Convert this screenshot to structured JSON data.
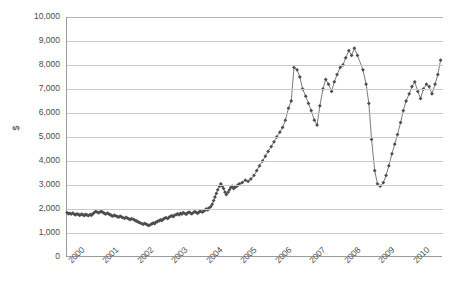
{
  "chart_data": {
    "type": "line",
    "title": "",
    "subtitle": "",
    "xlabel": "",
    "ylabel": "$",
    "legend": [],
    "legend_position": "none",
    "grid": true,
    "marker": "diamond",
    "marker_color": "#4d4d4d",
    "line_color": "#595959",
    "xlim": [
      2000,
      2010.9
    ],
    "ylim": [
      0,
      10000
    ],
    "ytick_labels": [
      "10,000",
      "9,000",
      "8,000",
      "7,000",
      "6,000",
      "5,000",
      "4,000",
      "3,000",
      "2,000",
      "1,000",
      "0"
    ],
    "ytick_values": [
      10000,
      9000,
      8000,
      7000,
      6000,
      5000,
      4000,
      3000,
      2000,
      1000,
      0
    ],
    "xtick_labels": [
      "2000",
      "2001",
      "2002",
      "2003",
      "2004",
      "2005",
      "2006",
      "2007",
      "2008",
      "2009",
      "2010"
    ],
    "xtick_values": [
      2000,
      2001,
      2002,
      2003,
      2004,
      2005,
      2006,
      2007,
      2008,
      2009,
      2010
    ],
    "series": [
      {
        "name": "$",
        "x": [
          2000.0,
          2000.04,
          2000.08,
          2000.12,
          2000.17,
          2000.21,
          2000.25,
          2000.29,
          2000.33,
          2000.37,
          2000.42,
          2000.46,
          2000.5,
          2000.54,
          2000.58,
          2000.62,
          2000.67,
          2000.71,
          2000.75,
          2000.79,
          2000.83,
          2000.87,
          2000.92,
          2000.96,
          2001.0,
          2001.04,
          2001.08,
          2001.12,
          2001.17,
          2001.21,
          2001.25,
          2001.29,
          2001.33,
          2001.37,
          2001.42,
          2001.46,
          2001.5,
          2001.54,
          2001.58,
          2001.62,
          2001.67,
          2001.71,
          2001.75,
          2001.79,
          2001.83,
          2001.87,
          2001.92,
          2001.96,
          2002.0,
          2002.04,
          2002.08,
          2002.12,
          2002.17,
          2002.21,
          2002.25,
          2002.29,
          2002.33,
          2002.37,
          2002.42,
          2002.46,
          2002.5,
          2002.54,
          2002.58,
          2002.62,
          2002.67,
          2002.71,
          2002.75,
          2002.79,
          2002.83,
          2002.87,
          2002.92,
          2002.96,
          2003.0,
          2003.04,
          2003.08,
          2003.12,
          2003.17,
          2003.21,
          2003.25,
          2003.29,
          2003.33,
          2003.37,
          2003.42,
          2003.46,
          2003.5,
          2003.54,
          2003.58,
          2003.62,
          2003.67,
          2003.71,
          2003.75,
          2003.79,
          2003.83,
          2003.87,
          2003.92,
          2003.96,
          2004.0,
          2004.04,
          2004.08,
          2004.12,
          2004.17,
          2004.21,
          2004.25,
          2004.29,
          2004.33,
          2004.37,
          2004.42,
          2004.46,
          2004.5,
          2004.54,
          2004.58,
          2004.62,
          2004.67,
          2004.71,
          2004.75,
          2004.79,
          2004.83,
          2004.87,
          2004.92,
          2004.96,
          2005.0,
          2005.08,
          2005.17,
          2005.25,
          2005.33,
          2005.42,
          2005.5,
          2005.58,
          2005.67,
          2005.75,
          2005.83,
          2005.92,
          2006.0,
          2006.08,
          2006.17,
          2006.25,
          2006.33,
          2006.42,
          2006.5,
          2006.58,
          2006.67,
          2006.75,
          2006.83,
          2006.92,
          2007.0,
          2007.08,
          2007.17,
          2007.25,
          2007.33,
          2007.42,
          2007.5,
          2007.58,
          2007.67,
          2007.75,
          2007.83,
          2007.92,
          2008.0,
          2008.08,
          2008.17,
          2008.25,
          2008.33,
          2008.42,
          2008.58,
          2008.67,
          2008.75,
          2008.83,
          2008.92,
          2009.0,
          2009.08,
          2009.17,
          2009.25,
          2009.33,
          2009.42,
          2009.5,
          2009.58,
          2009.67,
          2009.75,
          2009.83,
          2009.92,
          2010.0,
          2010.08,
          2010.17,
          2010.25,
          2010.33,
          2010.42,
          2010.5,
          2010.58,
          2010.67,
          2010.75,
          2010.83
        ],
        "values": [
          1850,
          1800,
          1820,
          1790,
          1830,
          1780,
          1760,
          1800,
          1770,
          1740,
          1790,
          1760,
          1730,
          1780,
          1750,
          1720,
          1770,
          1740,
          1800,
          1850,
          1900,
          1870,
          1840,
          1880,
          1900,
          1860,
          1820,
          1790,
          1830,
          1800,
          1760,
          1730,
          1700,
          1740,
          1710,
          1680,
          1660,
          1700,
          1670,
          1640,
          1610,
          1650,
          1620,
          1590,
          1560,
          1600,
          1570,
          1540,
          1510,
          1480,
          1450,
          1420,
          1390,
          1360,
          1400,
          1370,
          1340,
          1310,
          1350,
          1380,
          1420,
          1390,
          1450,
          1480,
          1510,
          1550,
          1520,
          1580,
          1610,
          1640,
          1600,
          1660,
          1690,
          1720,
          1680,
          1740,
          1770,
          1800,
          1760,
          1820,
          1790,
          1850,
          1810,
          1780,
          1840,
          1870,
          1830,
          1800,
          1860,
          1890,
          1850,
          1820,
          1880,
          1910,
          1870,
          1900,
          1950,
          2000,
          1960,
          2050,
          2100,
          2200,
          2350,
          2500,
          2650,
          2800,
          2950,
          3050,
          2950,
          2850,
          2700,
          2600,
          2700,
          2800,
          2900,
          2950,
          2850,
          2900,
          2950,
          3000,
          3050,
          3100,
          3200,
          3150,
          3250,
          3400,
          3600,
          3800,
          4000,
          4200,
          4400,
          4600,
          4800,
          5000,
          5200,
          5400,
          5700,
          6200,
          6500,
          7900,
          7800,
          7500,
          7000,
          6700,
          6400,
          6100,
          5700,
          5500,
          6300,
          7000,
          7400,
          7200,
          6900,
          7300,
          7600,
          7900,
          8000,
          8300,
          8600,
          8400,
          8700,
          8400,
          7800,
          7200,
          6400,
          4900,
          3600,
          3050,
          2950,
          3100,
          3400,
          3800,
          4300,
          4700,
          5100,
          5600,
          6100,
          6500,
          6800,
          7100,
          7300,
          6900,
          6600,
          7000,
          7200,
          7100,
          6800,
          7200,
          7600,
          8200
        ]
      }
    ]
  }
}
